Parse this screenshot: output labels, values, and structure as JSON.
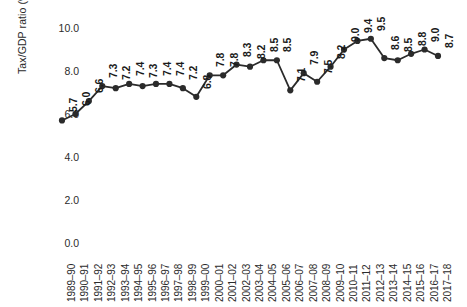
{
  "chart_data": {
    "type": "line",
    "title": "",
    "xlabel": "",
    "ylabel": "Tax/GDP ratio (%)",
    "ylim": [
      0.0,
      10.0
    ],
    "yticks": [
      "10.0",
      "8.0",
      "6.0",
      "4.0",
      "2.0",
      "0.0"
    ],
    "ytick_values": [
      10.0,
      8.0,
      6.0,
      4.0,
      2.0,
      0.0
    ],
    "grid": false,
    "legend": "none",
    "marker": "filled-circle",
    "line_color": "#2b2b2b",
    "marker_color": "#2b2b2b",
    "data_labels_shown": true,
    "categories": [
      "1989–90",
      "1990–91",
      "1991–92",
      "1992–93",
      "1993–94",
      "1994–95",
      "1995–96",
      "1996–97",
      "1997–98",
      "1998–99",
      "1999–00",
      "2000–01",
      "2001–02",
      "2002–03",
      "2003–04",
      "2004–05",
      "2005–06",
      "2006–07",
      "2007–08",
      "2008–09",
      "2009–10",
      "2010–11",
      "2011–12",
      "2012–13",
      "2013–14",
      "2014–15",
      "2015–16",
      "2016–17",
      "2017–18"
    ],
    "values": [
      5.7,
      6.0,
      6.6,
      7.3,
      7.2,
      7.4,
      7.3,
      7.4,
      7.4,
      7.2,
      6.8,
      7.8,
      7.8,
      8.3,
      8.2,
      8.5,
      8.5,
      7.1,
      7.9,
      7.5,
      8.2,
      9.0,
      9.4,
      9.5,
      8.6,
      8.5,
      8.8,
      9.0,
      8.7
    ],
    "value_labels": [
      "5.7",
      "6.0",
      "6.6",
      "7.3",
      "7.2",
      "7.4",
      "7.3",
      "7.4",
      "7.4",
      "7.2",
      "6.8",
      "7.8",
      "7.8",
      "8.3",
      "8.2",
      "8.5",
      "8.5",
      "7.1",
      "7.9",
      "7.5",
      "8.2",
      "9.0",
      "9.4",
      "9.5",
      "8.6",
      "8.5",
      "8.8",
      "9.0",
      "8.7"
    ]
  }
}
